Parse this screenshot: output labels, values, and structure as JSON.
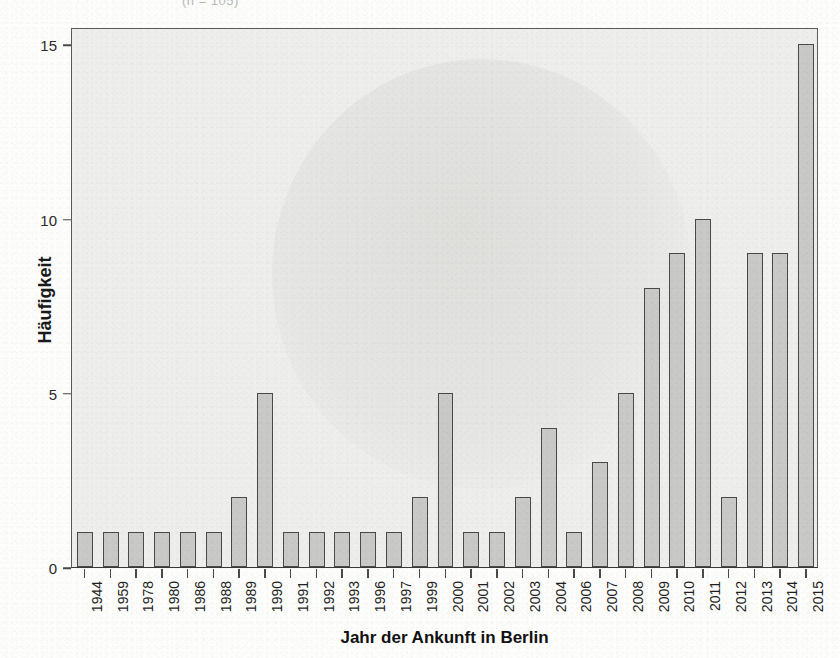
{
  "top_ghost_text": "(n = 105)",
  "chart_data": {
    "type": "bar",
    "title": "",
    "xlabel": "Jahr der Ankunft in Berlin",
    "ylabel": "Häufigkeit",
    "ylim": [
      0,
      15.5
    ],
    "yticks": [
      0,
      5,
      10,
      15
    ],
    "ytick_labels": [
      "0",
      "5",
      "10",
      "15"
    ],
    "grid": false,
    "legend": "none",
    "bar_fill_color": "#c9c9c7",
    "bar_edge_color": "#4a4a4a",
    "panel_color": "#eeeeec",
    "categories": [
      "1944",
      "1959",
      "1978",
      "1980",
      "1986",
      "1988",
      "1989",
      "1990",
      "1991",
      "1992",
      "1993",
      "1996",
      "1997",
      "1999",
      "2000",
      "2001",
      "2002",
      "2003",
      "2004",
      "2006",
      "2007",
      "2008",
      "2009",
      "2010",
      "2011",
      "2012",
      "2013",
      "2014",
      "2015"
    ],
    "values": [
      1,
      1,
      1,
      1,
      1,
      1,
      2,
      5,
      1,
      1,
      1,
      1,
      1,
      2,
      5,
      1,
      1,
      2,
      4,
      1,
      3,
      5,
      8,
      9,
      10,
      2,
      9,
      9,
      15
    ]
  }
}
